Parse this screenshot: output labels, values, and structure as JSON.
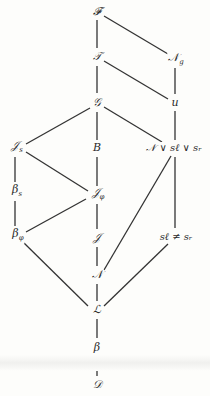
{
  "diagram": {
    "title": "",
    "nodes": [
      {
        "id": "F",
        "label": "𝓕",
        "sub": "",
        "x": 97,
        "y": 12
      },
      {
        "id": "T",
        "label": "𝒯",
        "sub": "",
        "x": 97,
        "y": 57
      },
      {
        "id": "Ng",
        "label": "𝒩",
        "sub": "g",
        "x": 176,
        "y": 60
      },
      {
        "id": "G",
        "label": "𝒢",
        "sub": "",
        "x": 97,
        "y": 103
      },
      {
        "id": "u",
        "label": "u",
        "sub": "",
        "x": 175,
        "y": 103
      },
      {
        "id": "Js",
        "label": "𝒥",
        "sub": "s",
        "x": 17,
        "y": 148
      },
      {
        "id": "B",
        "label": "B",
        "sub": "",
        "x": 97,
        "y": 148
      },
      {
        "id": "NvSlvSr",
        "label": "𝒩 ∨ s_ℓ ∨ s_r",
        "sub": "",
        "x": 174,
        "y": 148
      },
      {
        "id": "betas",
        "label": "β",
        "sub": "s",
        "x": 17,
        "y": 192
      },
      {
        "id": "Jphi",
        "label": "𝒥",
        "sub": "φ",
        "x": 98,
        "y": 195
      },
      {
        "id": "betaphi",
        "label": "β",
        "sub": "φ",
        "x": 18,
        "y": 236
      },
      {
        "id": "J",
        "label": "𝒥",
        "sub": "",
        "x": 97,
        "y": 238
      },
      {
        "id": "SlneqSr",
        "label": "s_ℓ ≠ s_r",
        "sub": "",
        "x": 176,
        "y": 237
      },
      {
        "id": "N",
        "label": "𝒩",
        "sub": "",
        "x": 97,
        "y": 275
      },
      {
        "id": "L",
        "label": "ℒ",
        "sub": "",
        "x": 97,
        "y": 310
      },
      {
        "id": "beta",
        "label": "β",
        "sub": "",
        "x": 97,
        "y": 348
      },
      {
        "id": "D",
        "label": "𝒟",
        "sub": "",
        "x": 97,
        "y": 385
      }
    ],
    "edges": [
      [
        "F",
        "T"
      ],
      [
        "F",
        "Ng"
      ],
      [
        "T",
        "G"
      ],
      [
        "T",
        "u"
      ],
      [
        "Ng",
        "u"
      ],
      [
        "G",
        "Js"
      ],
      [
        "G",
        "B"
      ],
      [
        "G",
        "NvSlvSr"
      ],
      [
        "u",
        "NvSlvSr"
      ],
      [
        "Js",
        "betas"
      ],
      [
        "Js",
        "Jphi"
      ],
      [
        "B",
        "Jphi"
      ],
      [
        "betas",
        "betaphi"
      ],
      [
        "Jphi",
        "betaphi"
      ],
      [
        "Jphi",
        "J"
      ],
      [
        "NvSlvSr",
        "N"
      ],
      [
        "NvSlvSr",
        "SlneqSr"
      ],
      [
        "J",
        "N"
      ],
      [
        "betaphi",
        "L"
      ],
      [
        "N",
        "L"
      ],
      [
        "SlneqSr",
        "L"
      ],
      [
        "L",
        "beta"
      ],
      [
        "beta",
        "D"
      ]
    ],
    "colors": {
      "line": "#333333",
      "text": "#2a2a2a",
      "background": "#fdfdfb"
    }
  },
  "labels": {
    "F": "𝓕",
    "T": "𝒯",
    "Ng": "𝒩",
    "Ng_sub": "g",
    "G": "𝒢",
    "u": "u",
    "Js": "𝒥",
    "Js_sub": "s",
    "B": "B",
    "NvSlvSr": "𝒩 ∨ sℓ ∨ sᵣ",
    "betas": "β",
    "betas_sub": "s",
    "Jphi": "𝒥",
    "Jphi_sub": "φ",
    "betaphi": "β",
    "betaphi_sub": "φ",
    "J": "𝒥",
    "SlneqSr": "sℓ ≠ sᵣ",
    "N": "𝒩",
    "L": "ℒ",
    "beta": "β",
    "D": "𝒟"
  }
}
